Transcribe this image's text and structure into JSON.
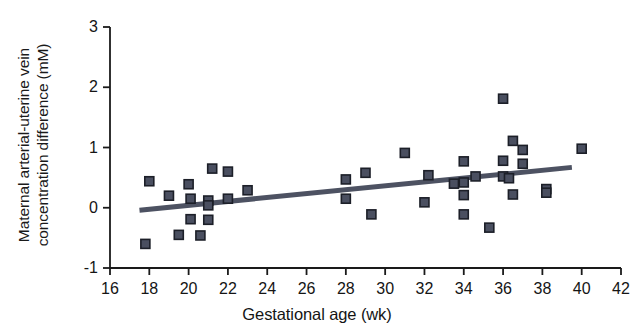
{
  "chart_data": {
    "type": "scatter",
    "title": "",
    "xlabel": "Gestational age (wk)",
    "ylabel_line1": "Maternal arterial-uterine vein",
    "ylabel_line2": "concentration difference (mM)",
    "xlim": [
      16,
      42
    ],
    "ylim": [
      -1,
      3
    ],
    "xticks": [
      16,
      18,
      20,
      22,
      24,
      26,
      28,
      30,
      32,
      34,
      36,
      38,
      40,
      42
    ],
    "yticks": [
      -1,
      0,
      1,
      2,
      3
    ],
    "xtick_labels": [
      "16",
      "18",
      "20",
      "22",
      "24",
      "26",
      "28",
      "30",
      "32",
      "34",
      "36",
      "38",
      "40",
      "42"
    ],
    "ytick_labels": [
      "-1",
      "0",
      "1",
      "2",
      "3"
    ],
    "grid": false,
    "legend": null,
    "marker_color": "#4a4f60",
    "marker_edge_color": "#1c1f28",
    "marker_shape": "square",
    "marker_size_px": 9,
    "trendline": {
      "color": "#4d5262",
      "width_px": 5,
      "x_start": 17.5,
      "y_start": -0.04,
      "x_end": 39.5,
      "y_end": 0.67
    },
    "points": [
      {
        "x": 17.8,
        "y": -0.6
      },
      {
        "x": 18.0,
        "y": 0.44
      },
      {
        "x": 19.0,
        "y": 0.2
      },
      {
        "x": 19.5,
        "y": -0.45
      },
      {
        "x": 20.0,
        "y": 0.39
      },
      {
        "x": 20.1,
        "y": 0.15
      },
      {
        "x": 20.1,
        "y": -0.19
      },
      {
        "x": 20.6,
        "y": -0.46
      },
      {
        "x": 21.0,
        "y": 0.12
      },
      {
        "x": 21.0,
        "y": 0.04
      },
      {
        "x": 21.0,
        "y": -0.2
      },
      {
        "x": 21.2,
        "y": 0.65
      },
      {
        "x": 22.0,
        "y": 0.6
      },
      {
        "x": 22.0,
        "y": 0.15
      },
      {
        "x": 23.0,
        "y": 0.29
      },
      {
        "x": 28.0,
        "y": 0.47
      },
      {
        "x": 28.0,
        "y": 0.15
      },
      {
        "x": 29.0,
        "y": 0.58
      },
      {
        "x": 29.3,
        "y": -0.11
      },
      {
        "x": 31.0,
        "y": 0.91
      },
      {
        "x": 32.0,
        "y": 0.09
      },
      {
        "x": 32.2,
        "y": 0.54
      },
      {
        "x": 33.5,
        "y": 0.4
      },
      {
        "x": 34.0,
        "y": 0.77
      },
      {
        "x": 34.0,
        "y": 0.42
      },
      {
        "x": 34.0,
        "y": 0.21
      },
      {
        "x": 34.0,
        "y": -0.11
      },
      {
        "x": 34.6,
        "y": 0.52
      },
      {
        "x": 35.3,
        "y": -0.33
      },
      {
        "x": 36.0,
        "y": 1.81
      },
      {
        "x": 36.0,
        "y": 0.78
      },
      {
        "x": 36.0,
        "y": 0.52
      },
      {
        "x": 36.3,
        "y": 0.49
      },
      {
        "x": 36.5,
        "y": 1.11
      },
      {
        "x": 36.5,
        "y": 0.22
      },
      {
        "x": 37.0,
        "y": 0.96
      },
      {
        "x": 37.0,
        "y": 0.73
      },
      {
        "x": 38.2,
        "y": 0.31
      },
      {
        "x": 38.2,
        "y": 0.25
      },
      {
        "x": 40.0,
        "y": 0.98
      }
    ]
  }
}
